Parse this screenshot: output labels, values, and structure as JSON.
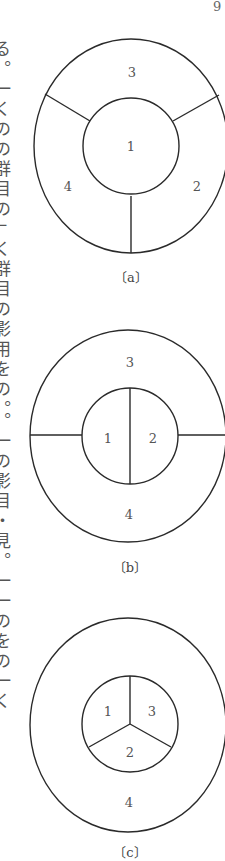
{
  "page": {
    "page_number": "9",
    "side_text_fragment": "る。一くのの群目の」く群目の影用をの。。一の影目・見。一一のをの一く"
  },
  "figures": [
    {
      "id": "a",
      "caption": "〔a〕",
      "regions": [
        {
          "label": "1",
          "x": 131,
          "y": 151
        },
        {
          "label": "2",
          "x": 197,
          "y": 191
        },
        {
          "label": "3",
          "x": 132,
          "y": 77
        },
        {
          "label": "4",
          "x": 68,
          "y": 191
        }
      ]
    },
    {
      "id": "b",
      "caption": "〔b〕",
      "regions": [
        {
          "label": "1",
          "x": 108,
          "y": 443
        },
        {
          "label": "2",
          "x": 153,
          "y": 443
        },
        {
          "label": "3",
          "x": 130,
          "y": 367
        },
        {
          "label": "4",
          "x": 129,
          "y": 519
        }
      ]
    },
    {
      "id": "c",
      "caption": "〔c〕",
      "regions": [
        {
          "label": "1",
          "x": 108,
          "y": 716
        },
        {
          "label": "2",
          "x": 130,
          "y": 757
        },
        {
          "label": "3",
          "x": 152,
          "y": 716
        },
        {
          "label": "4",
          "x": 129,
          "y": 807
        }
      ]
    }
  ]
}
